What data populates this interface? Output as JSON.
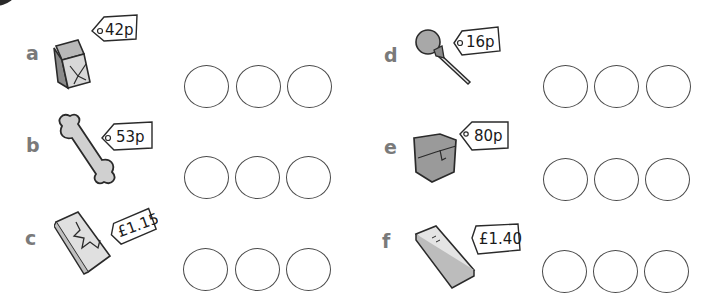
{
  "exercise": {
    "items": [
      {
        "letter": "a",
        "object": "parcel",
        "price": "42p"
      },
      {
        "letter": "b",
        "object": "dog-bone",
        "price": "53p"
      },
      {
        "letter": "c",
        "object": "chocolate-bar",
        "price": "£1.15"
      },
      {
        "letter": "d",
        "object": "lollipop",
        "price": "16p"
      },
      {
        "letter": "e",
        "object": "box",
        "price": "80p"
      },
      {
        "letter": "f",
        "object": "notebook",
        "price": "£1.40"
      }
    ],
    "circles_per_item": 3,
    "colors": {
      "letter": "#7a7a7a",
      "outline": "#2a2a2a",
      "circle_border": "#4a4a4a",
      "fill_grey": "#9a9a9a",
      "fill_light": "#d4d4d4"
    }
  }
}
